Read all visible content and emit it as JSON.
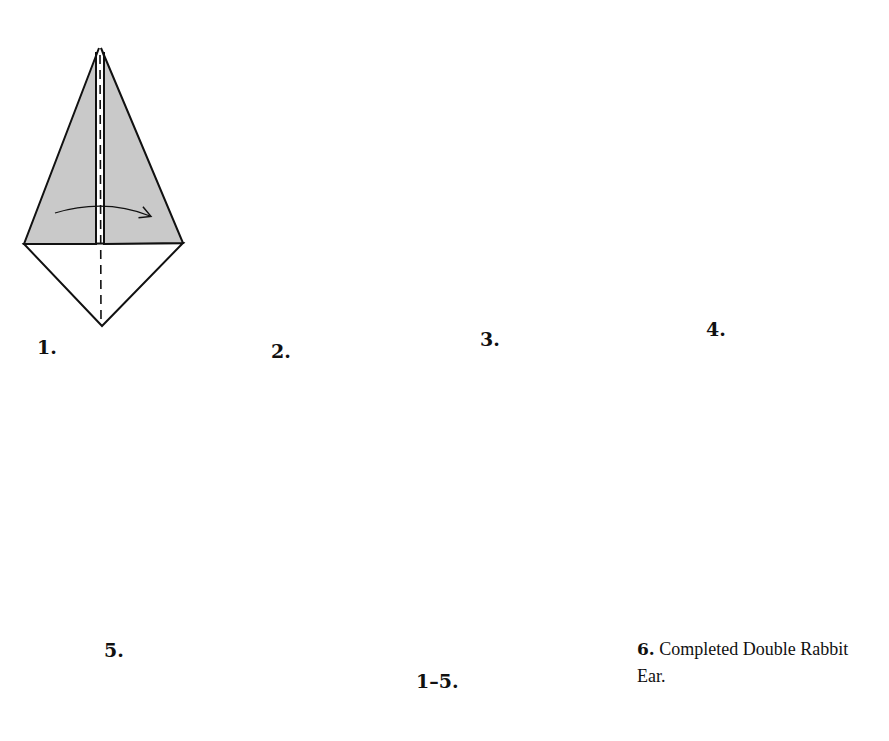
{
  "diagram": {
    "title": "Double Rabbit Ear",
    "colors": {
      "paper_fill": "#c9c9c9",
      "line": "#111111",
      "background": "#ffffff"
    },
    "steps": [
      {
        "id": "1",
        "label": "1.",
        "instruction_icons": [
          "valley-fold-line",
          "fold-arrow-right"
        ]
      },
      {
        "id": "2",
        "label": "2.",
        "instruction_icons": [
          "mountain-fold-line",
          "fold-arrow-down-right"
        ]
      },
      {
        "id": "3",
        "label": "3.",
        "instruction_icons": [
          "mountain-fold-line",
          "fold-arrow-loop"
        ]
      },
      {
        "id": "4",
        "label": "4.",
        "instruction_icons": []
      },
      {
        "id": "5",
        "label": "5.",
        "instruction_icons": [
          "valley-fold-line",
          "fold-arrow-left"
        ]
      },
      {
        "id": "1-5",
        "label": "1–5.",
        "instruction_icons": [
          "push-arrow",
          "mountain-fold-line",
          "valley-fold-line",
          "fold-arrow-left"
        ]
      },
      {
        "id": "6",
        "label": "6.",
        "caption": "Completed Double Rabbit Ear."
      }
    ],
    "final_caption": {
      "number": "6.",
      "text": "Completed Double Rabbit Ear."
    }
  }
}
